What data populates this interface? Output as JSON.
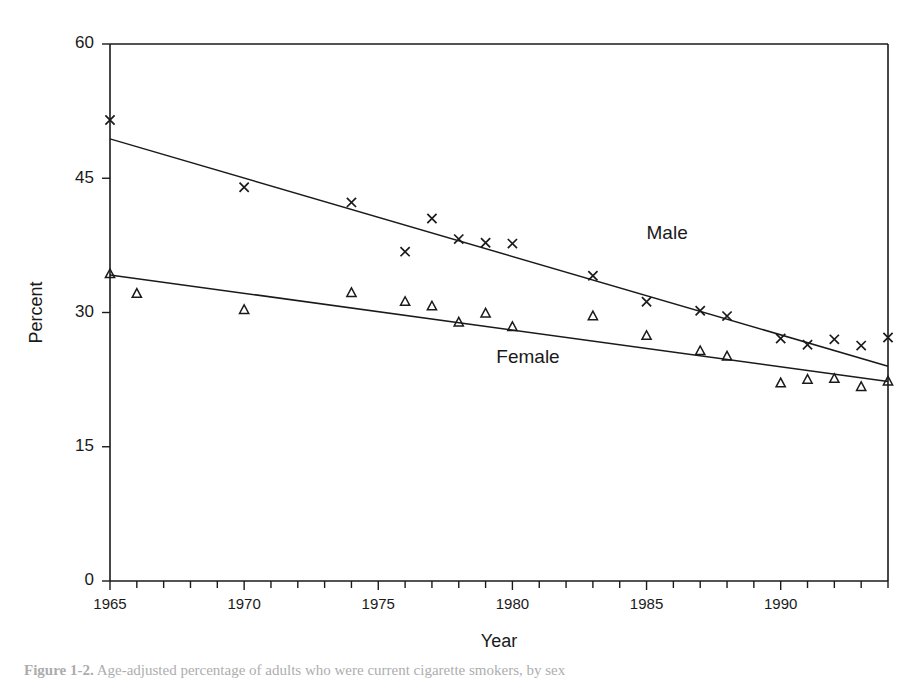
{
  "figure": {
    "caption_prefix": "Figure 1-2.",
    "caption_rest": "Age-adjusted percentage of adults who were current cigarette smokers, by sex",
    "background_color": "#ffffff",
    "ink_color": "#1a1a1a"
  },
  "chart_data": {
    "type": "scatter",
    "title": "",
    "subtitle": "",
    "xlabel": "Year",
    "ylabel": "Percent",
    "xlim": [
      1965,
      1994
    ],
    "ylim": [
      0,
      60
    ],
    "yticks": [
      0,
      15,
      30,
      45,
      60
    ],
    "ytick_labels": [
      "0",
      "15",
      "30",
      "45",
      "60"
    ],
    "xticks_major": [
      1965,
      1970,
      1975,
      1980,
      1985,
      1990
    ],
    "xtick_labels": [
      "1965",
      "1970",
      "1975",
      "1980",
      "1985",
      "1990"
    ],
    "xticks_minor_step": 1,
    "grid": false,
    "legend_position": "inline-annotation",
    "series": [
      {
        "name": "Male",
        "marker": "x",
        "label_text": "Male",
        "label_x": 1985.0,
        "label_y": 38.2,
        "trend_start": [
          1965,
          49.4
        ],
        "trend_end": [
          1994,
          24.0
        ],
        "x": [
          1965,
          1970,
          1974,
          1976,
          1977,
          1978,
          1979,
          1980,
          1983,
          1985,
          1987,
          1988,
          1990,
          1991,
          1992,
          1993,
          1994
        ],
        "values": [
          51.5,
          44.0,
          42.3,
          36.8,
          40.5,
          38.2,
          37.8,
          37.7,
          34.1,
          31.2,
          30.2,
          29.6,
          27.1,
          26.4,
          27.0,
          26.3,
          27.2
        ]
      },
      {
        "name": "Female",
        "marker": "triangle",
        "label_text": "Female",
        "label_x": 1979.4,
        "label_y": 24.4,
        "trend_start": [
          1965,
          34.2
        ],
        "trend_end": [
          1994,
          22.3
        ],
        "x": [
          1965,
          1966,
          1970,
          1974,
          1976,
          1977,
          1978,
          1979,
          1980,
          1983,
          1985,
          1987,
          1988,
          1990,
          1991,
          1992,
          1993,
          1994
        ],
        "values": [
          34.3,
          32.1,
          30.3,
          32.2,
          31.2,
          30.7,
          28.9,
          29.9,
          28.4,
          29.6,
          27.4,
          25.7,
          25.1,
          22.1,
          22.5,
          22.6,
          21.7,
          22.3
        ]
      }
    ]
  }
}
